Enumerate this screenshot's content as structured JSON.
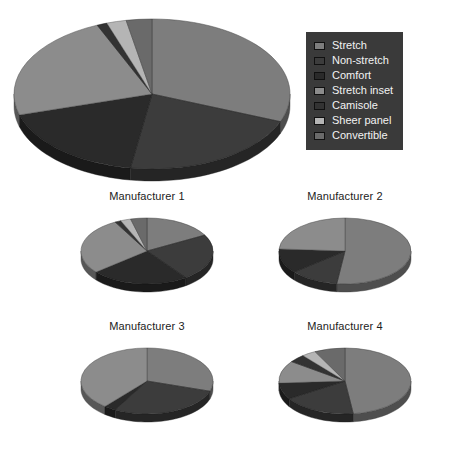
{
  "legend": {
    "position": "top-right",
    "background": "#3a3a3a",
    "text_color": "#f2f2f2",
    "items": [
      {
        "label": "Stretch",
        "color": "#7d7d7d"
      },
      {
        "label": "Non-stretch",
        "color": "#3c3c3c"
      },
      {
        "label": "Comfort",
        "color": "#2a2a2a"
      },
      {
        "label": "Stretch inset",
        "color": "#8c8c8c"
      },
      {
        "label": "Camisole",
        "color": "#333333"
      },
      {
        "label": "Sheer panel",
        "color": "#b5b5b5"
      },
      {
        "label": "Convertible",
        "color": "#6a6a6a"
      }
    ]
  },
  "chart_data": [
    {
      "type": "pie",
      "title": "",
      "name": "overall",
      "categories": [
        "Stretch",
        "Non-stretch",
        "Comfort",
        "Stretch inset",
        "Camisole",
        "Sheer panel",
        "Convertible"
      ],
      "values": [
        31.0,
        21.5,
        18.0,
        23.0,
        1.2,
        2.3,
        3.0
      ],
      "unit": "percent",
      "start_angle": 0,
      "rotation_deg": 0,
      "three_d": true,
      "legend": "shared"
    },
    {
      "type": "pie",
      "title": "Manufacturer 1",
      "name": "manufacturer-1",
      "categories": [
        "Stretch",
        "Non-stretch",
        "Comfort",
        "Stretch inset",
        "Camisole",
        "Sheer panel",
        "Convertible"
      ],
      "values": [
        17.0,
        23.0,
        24.0,
        28.0,
        1.5,
        2.5,
        4.0
      ],
      "unit": "percent",
      "three_d": true,
      "legend": "shared"
    },
    {
      "type": "pie",
      "title": "Manufacturer 2",
      "name": "manufacturer-2",
      "categories": [
        "Stretch",
        "Non-stretch",
        "Comfort",
        "Stretch inset",
        "Camisole",
        "Sheer panel",
        "Convertible"
      ],
      "values": [
        52.0,
        12.0,
        12.0,
        24.0,
        0.0,
        0.0,
        0.0
      ],
      "unit": "percent",
      "three_d": true,
      "legend": "shared"
    },
    {
      "type": "pie",
      "title": "Manufacturer 3",
      "name": "manufacturer-3",
      "categories": [
        "Stretch",
        "Non-stretch",
        "Comfort",
        "Stretch inset",
        "Camisole",
        "Sheer panel",
        "Convertible"
      ],
      "values": [
        30.0,
        28.0,
        3.0,
        39.0,
        0.0,
        0.0,
        0.0
      ],
      "unit": "percent",
      "three_d": true,
      "legend": "shared"
    },
    {
      "type": "pie",
      "title": "Manufacturer 4",
      "name": "manufacturer-4",
      "categories": [
        "Stretch",
        "Non-stretch",
        "Comfort",
        "Stretch inset",
        "Camisole",
        "Sheer panel",
        "Convertible"
      ],
      "values": [
        48.0,
        18.0,
        8.0,
        11.0,
        4.0,
        3.5,
        7.5
      ],
      "unit": "percent",
      "three_d": true,
      "legend": "shared"
    }
  ]
}
